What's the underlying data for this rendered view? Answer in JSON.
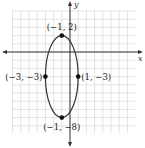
{
  "chart_data": {
    "type": "scatter",
    "title": "",
    "xlabel": "x",
    "ylabel": "y",
    "grid": true,
    "xlim": [
      -7,
      8
    ],
    "ylim": [
      -10,
      5
    ],
    "curve": {
      "shape": "ellipse",
      "center": [
        -1,
        -3
      ],
      "semi_axis_horizontal": 2,
      "semi_axis_vertical": 5
    },
    "points": [
      {
        "x": -1,
        "y": 2,
        "label": "(−1, 2)"
      },
      {
        "x": -3,
        "y": -3,
        "label": "(−3, −3)"
      },
      {
        "x": 1,
        "y": -3,
        "label": "(1, −3)"
      },
      {
        "x": -1,
        "y": -8,
        "label": "(−1, −8)"
      }
    ],
    "colors": {
      "grid": "#d9d9d9",
      "axis": "#333333",
      "curve": "#333333",
      "points": "#111111"
    }
  }
}
